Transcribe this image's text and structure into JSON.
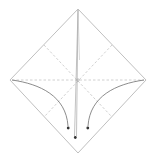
{
  "diagram": {
    "type": "origami-fold-diagram",
    "colors": {
      "background": "#ffffff",
      "outline": "#b8b8b8",
      "crease": "#c4c4c4",
      "arrow": "#6e6e6e",
      "arrowhead": "#333333"
    },
    "square": {
      "top": [
        78,
        9
      ],
      "right": [
        146,
        80
      ],
      "bottom": [
        78,
        153
      ],
      "left": [
        10,
        80
      ]
    },
    "creases": [
      {
        "name": "horizontal-diagonal",
        "from": [
          12,
          80
        ],
        "to": [
          144,
          80
        ],
        "style": "dashed"
      },
      {
        "name": "top-left-to-bottom-right-midline",
        "from": [
          44,
          45
        ],
        "to": [
          112,
          117
        ],
        "style": "dashed"
      },
      {
        "name": "top-right-to-bottom-left-midline",
        "from": [
          112,
          45
        ],
        "to": [
          44,
          117
        ],
        "style": "dashed"
      }
    ],
    "arrows": [
      {
        "name": "left-corner-fold-arrow",
        "direction": "down"
      },
      {
        "name": "right-corner-fold-arrow",
        "direction": "down"
      },
      {
        "name": "top-corner-fold-arrow",
        "direction": "down"
      }
    ]
  }
}
